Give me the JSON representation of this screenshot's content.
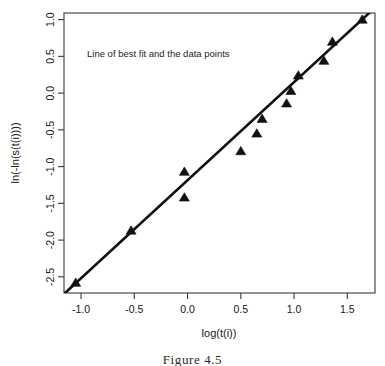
{
  "figure": {
    "caption": "Figure 4.5",
    "background_color": "#ffffff",
    "foreground_color": "#111111"
  },
  "chart_data": {
    "type": "scatter",
    "title": "",
    "annotation": "Line of best fit and the data points",
    "xlabel": "log(t(i))",
    "ylabel": "ln(-ln(s(t(i))))",
    "xlim": [
      -1.16,
      1.76
    ],
    "ylim": [
      -2.72,
      1.09
    ],
    "xticks": [
      -1.0,
      -0.5,
      0.0,
      0.5,
      1.0,
      1.5
    ],
    "xticklabels": [
      "-1.0",
      "-0.5",
      "0.0",
      "0.5",
      "1.0",
      "1.5"
    ],
    "yticks": [
      1.0,
      0.5,
      0.0,
      -0.5,
      -1.0,
      -1.5,
      -2.0,
      -2.5
    ],
    "yticklabels": [
      "1.0",
      "0.5",
      "0.0",
      "-0.5",
      "-1.0",
      "-1.5",
      "-2.0",
      "-2.5"
    ],
    "grid": false,
    "legend": false,
    "marker": "triangle-up",
    "marker_color": "#111111",
    "points": [
      {
        "x": -1.05,
        "y": -2.58
      },
      {
        "x": -0.53,
        "y": -1.87
      },
      {
        "x": -0.03,
        "y": -1.42
      },
      {
        "x": -0.03,
        "y": -1.07
      },
      {
        "x": 0.5,
        "y": -0.79
      },
      {
        "x": 0.65,
        "y": -0.55
      },
      {
        "x": 0.7,
        "y": -0.35
      },
      {
        "x": 0.93,
        "y": -0.14
      },
      {
        "x": 0.97,
        "y": 0.03
      },
      {
        "x": 1.04,
        "y": 0.24
      },
      {
        "x": 1.28,
        "y": 0.44
      },
      {
        "x": 1.36,
        "y": 0.7
      },
      {
        "x": 1.64,
        "y": 1.0
      }
    ],
    "fit_line": {
      "name": "Line of best fit",
      "color": "#111111",
      "slope": 1.335,
      "intercept": -1.185,
      "x_start": -1.15,
      "x_end": 1.75,
      "y_start": -2.72,
      "y_end": 1.15
    }
  }
}
